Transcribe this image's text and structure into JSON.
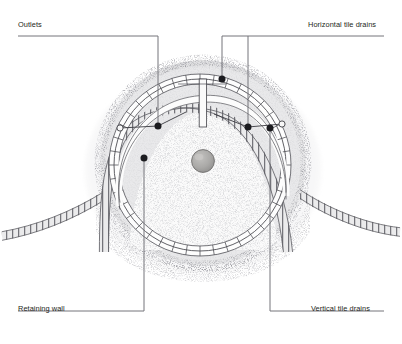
{
  "diagram": {
    "title_visible": false,
    "background_color": "#ffffff",
    "ink_color": "#231f20",
    "leader_color": "#6e6e72",
    "stone_color": "#a9a8a6",
    "labels": [
      {
        "id": "outlets",
        "text": "Outlets",
        "position": "top-left",
        "leader_target": "upper-left-ring-node"
      },
      {
        "id": "horizontal_drains",
        "text": "Horizontal tile drains",
        "position": "top-right",
        "leader_target": "upper-right-ring-nodes"
      },
      {
        "id": "retaining_wall",
        "text": "Retaining wall",
        "position": "bottom-left",
        "leader_target": "inner-wall-left"
      },
      {
        "id": "vertical_drains",
        "text": "Vertical tile drains",
        "position": "bottom-right",
        "leader_target": "outer-ring-right"
      }
    ],
    "elements": [
      {
        "name": "mound",
        "shape": "circle",
        "cx": 203,
        "cy": 163,
        "r": 102
      },
      {
        "name": "outer-tile-ring",
        "shape": "arc-of-segments",
        "cx": 200,
        "cy": 165,
        "r": 86,
        "segments": 40
      },
      {
        "name": "inner-retaining-wall",
        "shape": "arc-hatched-band",
        "cx": 203,
        "cy": 186,
        "r": 74
      },
      {
        "name": "left-wall-wing",
        "shape": "hatched-band",
        "from": "mound-left",
        "to": "left-edge"
      },
      {
        "name": "right-wall-wing",
        "shape": "hatched-band",
        "from": "mound-right",
        "to": "right-edge"
      },
      {
        "name": "center-stone",
        "shape": "circle",
        "cx": 203,
        "cy": 161,
        "r": 11
      },
      {
        "name": "vertical-drain-channel",
        "shape": "double-line",
        "x": 203,
        "y1": 79,
        "y2": 125
      },
      {
        "name": "radial-spokes",
        "count": 4
      }
    ],
    "leader_dots": [
      {
        "id": "dot-outlets-left",
        "x": 158,
        "y": 126
      },
      {
        "id": "dot-horiz-a",
        "x": 222,
        "y": 79
      },
      {
        "id": "dot-horiz-b",
        "x": 248,
        "y": 127
      },
      {
        "id": "dot-vert-right",
        "x": 270,
        "y": 128
      },
      {
        "id": "dot-retain-left",
        "x": 144,
        "y": 158
      }
    ]
  }
}
